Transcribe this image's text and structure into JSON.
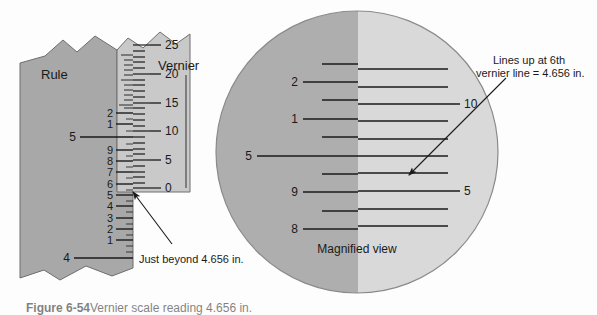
{
  "figure": {
    "caption_label": "Figure 6-54",
    "caption_text": "Vernier scale reading 4.656 in.",
    "colors": {
      "rule_gray": "#a8a8a8",
      "vernier_gray": "#c9c9c9",
      "magnified_left_gray": "#aeaeae",
      "magnified_right_gray": "#d9d9d9",
      "line": "#1a1a1a",
      "text": "#1a1a1a",
      "background": "#fdfdfd"
    }
  },
  "rule": {
    "label": "Rule",
    "ticks": [
      {
        "value": "",
        "y": 63,
        "major": false
      },
      {
        "value": "",
        "y": 70,
        "major": false
      },
      {
        "value": "",
        "y": 77,
        "major": false
      },
      {
        "value": "2",
        "y": 113,
        "major": true
      },
      {
        "value": "1",
        "y": 124,
        "major": true
      },
      {
        "value": "5",
        "y": 137,
        "major": true,
        "long": true
      },
      {
        "value": "9",
        "y": 150,
        "major": true
      },
      {
        "value": "8",
        "y": 161,
        "major": true
      },
      {
        "value": "7",
        "y": 172,
        "major": true
      },
      {
        "value": "6",
        "y": 184,
        "major": true
      },
      {
        "value": "5",
        "y": 195,
        "major": true
      },
      {
        "value": "4",
        "y": 206,
        "major": true
      },
      {
        "value": "3",
        "y": 218,
        "major": true
      },
      {
        "value": "2",
        "y": 229,
        "major": true
      },
      {
        "value": "1",
        "y": 240,
        "major": true
      },
      {
        "value": "4",
        "y": 258,
        "major": true,
        "long": true
      }
    ]
  },
  "vernier": {
    "label": "Vernier",
    "ticks": [
      {
        "value": "25",
        "y": 45
      },
      {
        "value": "20",
        "y": 74
      },
      {
        "value": "15",
        "y": 103
      },
      {
        "value": "10",
        "y": 131
      },
      {
        "value": "5",
        "y": 160
      },
      {
        "value": "0",
        "y": 188
      }
    ]
  },
  "annotations": {
    "just_beyond": "Just beyond 4.656 in.",
    "lines_up_line1": "Lines up at 6th",
    "lines_up_line2": "vernier line = 4.656 in."
  },
  "magnified": {
    "label": "Magnified view",
    "rule_numbers": [
      {
        "value": "2",
        "y": 82
      },
      {
        "value": "1",
        "y": 119
      },
      {
        "value": "5",
        "y": 156
      },
      {
        "value": "9",
        "y": 192
      },
      {
        "value": "8",
        "y": 229
      }
    ],
    "vernier_numbers": [
      {
        "value": "10",
        "y": 101
      },
      {
        "value": "5",
        "y": 192
      }
    ],
    "rule_lines_y": [
      64,
      82,
      100,
      119,
      137,
      156,
      174,
      192,
      211,
      229
    ],
    "vernier_lines_y": [
      69,
      87,
      104,
      121,
      139,
      156,
      173,
      191,
      209,
      226
    ]
  }
}
